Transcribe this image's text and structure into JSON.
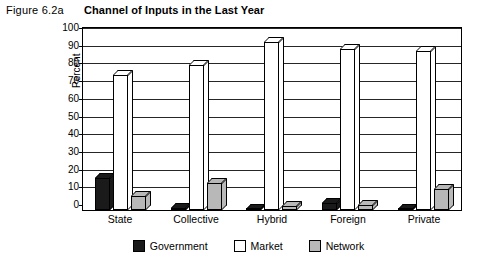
{
  "figure": {
    "label": "Figure 6.2a",
    "title": "Channel of Inputs in the Last Year"
  },
  "chart_data": {
    "type": "bar",
    "title": "Channel of Inputs in the Last Year",
    "xlabel": "",
    "ylabel": "Percent",
    "ylim": [
      0,
      100
    ],
    "yticks": [
      0,
      10,
      20,
      30,
      40,
      50,
      60,
      70,
      80,
      90,
      100
    ],
    "grid": true,
    "legend_position": "bottom",
    "categories": [
      "State",
      "Collective",
      "Hybrid",
      "Foreign",
      "Private"
    ],
    "series": [
      {
        "name": "Government",
        "color": "#1a1a1a",
        "values": [
          18,
          1,
          0,
          4,
          0
        ]
      },
      {
        "name": "Market",
        "color": "#ffffff",
        "values": [
          76,
          82,
          95,
          91,
          90
        ]
      },
      {
        "name": "Network",
        "color": "#b8b8b8",
        "values": [
          8,
          15,
          2,
          3,
          12
        ]
      }
    ]
  },
  "legend": {
    "items": [
      {
        "label": "Government"
      },
      {
        "label": "Market"
      },
      {
        "label": "Network"
      }
    ]
  }
}
